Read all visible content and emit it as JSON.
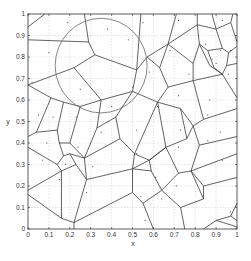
{
  "figure": {
    "xlabel": "x",
    "ylabel": "y",
    "xticks": [
      "0",
      "0.1",
      "0.2",
      "0.3",
      "0.4",
      "0.5",
      "0.6",
      "0.7",
      "0.8",
      "0.9",
      "1"
    ],
    "yticks": [
      "0",
      "0.1",
      "0.2",
      "0.3",
      "0.4",
      "0.5",
      "0.6",
      "0.7",
      "0.8",
      "0.9",
      "1"
    ]
  },
  "chart_data": {
    "type": "voronoi",
    "title": "",
    "xlabel": "x",
    "ylabel": "y",
    "xlim": [
      0,
      1
    ],
    "ylim": [
      0,
      1
    ],
    "grid": true,
    "circle": {
      "cx": 0.35,
      "cy": 0.76,
      "r": 0.22
    },
    "points": [
      [
        0.19,
        0.96
      ],
      [
        0.38,
        0.93
      ],
      [
        0.55,
        0.96
      ],
      [
        0.72,
        0.97
      ],
      [
        0.93,
        0.97
      ],
      [
        0.1,
        0.82
      ],
      [
        0.48,
        0.88
      ],
      [
        0.68,
        0.83
      ],
      [
        0.85,
        0.86
      ],
      [
        0.92,
        0.83
      ],
      [
        0.97,
        0.83
      ],
      [
        0.88,
        0.79
      ],
      [
        0.9,
        0.77
      ],
      [
        0.58,
        0.73
      ],
      [
        0.77,
        0.72
      ],
      [
        0.96,
        0.72
      ],
      [
        0.02,
        0.68
      ],
      [
        0.25,
        0.65
      ],
      [
        0.5,
        0.66
      ],
      [
        0.72,
        0.62
      ],
      [
        0.87,
        0.6
      ],
      [
        0.05,
        0.53
      ],
      [
        0.12,
        0.52
      ],
      [
        0.23,
        0.52
      ],
      [
        0.4,
        0.57
      ],
      [
        0.62,
        0.57
      ],
      [
        0.86,
        0.53
      ],
      [
        0.09,
        0.4
      ],
      [
        0.24,
        0.38
      ],
      [
        0.35,
        0.45
      ],
      [
        0.52,
        0.46
      ],
      [
        0.73,
        0.46
      ],
      [
        0.92,
        0.45
      ],
      [
        0.07,
        0.32
      ],
      [
        0.18,
        0.3
      ],
      [
        0.31,
        0.29
      ],
      [
        0.52,
        0.35
      ],
      [
        0.72,
        0.38
      ],
      [
        0.86,
        0.41
      ],
      [
        0.15,
        0.23
      ],
      [
        0.28,
        0.17
      ],
      [
        0.5,
        0.27
      ],
      [
        0.61,
        0.24
      ],
      [
        0.93,
        0.32
      ],
      [
        0.54,
        0.15
      ],
      [
        0.64,
        0.14
      ],
      [
        0.71,
        0.2
      ],
      [
        0.56,
        0.04
      ],
      [
        0.97,
        0.08
      ]
    ],
    "edges": [
      [
        [
          0,
          0.94
        ],
        [
          0.08,
          1
        ]
      ],
      [
        [
          0.27,
          1
        ],
        [
          0.29,
          0.87
        ]
      ],
      [
        [
          0,
          0.88
        ],
        [
          0.29,
          0.87
        ]
      ],
      [
        [
          0.29,
          0.87
        ],
        [
          0.32,
          0.81
        ]
      ],
      [
        [
          0.32,
          0.81
        ],
        [
          0.22,
          0.75
        ]
      ],
      [
        [
          0.22,
          0.75
        ],
        [
          0,
          0.67
        ]
      ],
      [
        [
          0.32,
          0.81
        ],
        [
          0.52,
          0.74
        ]
      ],
      [
        [
          0.52,
          0.74
        ],
        [
          0.54,
          1
        ]
      ],
      [
        [
          0.52,
          0.74
        ],
        [
          0.5,
          0.64
        ]
      ],
      [
        [
          0.52,
          0.74
        ],
        [
          0.57,
          0.8
        ]
      ],
      [
        [
          0.57,
          0.8
        ],
        [
          0.67,
          0.86
        ]
      ],
      [
        [
          0.67,
          0.86
        ],
        [
          0.71,
          1
        ]
      ],
      [
        [
          0.67,
          0.86
        ],
        [
          0.81,
          0.95
        ]
      ],
      [
        [
          0.81,
          0.95
        ],
        [
          0.81,
          1
        ]
      ],
      [
        [
          0.81,
          0.95
        ],
        [
          0.9,
          0.93
        ]
      ],
      [
        [
          0.9,
          0.93
        ],
        [
          0.88,
          1
        ]
      ],
      [
        [
          0.9,
          0.93
        ],
        [
          0.97,
          0.96
        ]
      ],
      [
        [
          0.97,
          0.96
        ],
        [
          0.98,
          1
        ]
      ],
      [
        [
          0.97,
          0.96
        ],
        [
          1,
          0.87
        ]
      ],
      [
        [
          0.9,
          0.93
        ],
        [
          0.93,
          0.84
        ]
      ],
      [
        [
          0.93,
          0.84
        ],
        [
          0.96,
          0.82
        ]
      ],
      [
        [
          0.96,
          0.82
        ],
        [
          1,
          0.85
        ]
      ],
      [
        [
          0.96,
          0.82
        ],
        [
          0.95,
          0.76
        ]
      ],
      [
        [
          0.95,
          0.76
        ],
        [
          1,
          0.77
        ]
      ],
      [
        [
          0.95,
          0.76
        ],
        [
          0.93,
          0.72
        ]
      ],
      [
        [
          0.93,
          0.84
        ],
        [
          0.86,
          0.83
        ]
      ],
      [
        [
          0.86,
          0.83
        ],
        [
          0.82,
          0.86
        ]
      ],
      [
        [
          0.82,
          0.86
        ],
        [
          0.81,
          0.95
        ]
      ],
      [
        [
          0.82,
          0.86
        ],
        [
          0.79,
          0.77
        ]
      ],
      [
        [
          0.86,
          0.83
        ],
        [
          0.89,
          0.75
        ]
      ],
      [
        [
          0.89,
          0.75
        ],
        [
          0.93,
          0.72
        ]
      ],
      [
        [
          0.82,
          0.86
        ],
        [
          0.87,
          0.76
        ]
      ],
      [
        [
          0.87,
          0.76
        ],
        [
          0.93,
          0.72
        ]
      ],
      [
        [
          0.67,
          0.86
        ],
        [
          0.63,
          0.75
        ]
      ],
      [
        [
          0.63,
          0.75
        ],
        [
          0.57,
          0.8
        ]
      ],
      [
        [
          0.63,
          0.75
        ],
        [
          0.67,
          0.66
        ]
      ],
      [
        [
          0.67,
          0.66
        ],
        [
          0.79,
          0.69
        ]
      ],
      [
        [
          0.79,
          0.69
        ],
        [
          0.79,
          0.77
        ]
      ],
      [
        [
          0.79,
          0.77
        ],
        [
          0.67,
          0.86
        ]
      ],
      [
        [
          0.79,
          0.69
        ],
        [
          0.93,
          0.72
        ]
      ],
      [
        [
          0.93,
          0.72
        ],
        [
          1,
          0.61
        ]
      ],
      [
        [
          0.79,
          0.69
        ],
        [
          0.84,
          0.51
        ]
      ],
      [
        [
          0.84,
          0.51
        ],
        [
          1,
          0.56
        ]
      ],
      [
        [
          0.84,
          0.51
        ],
        [
          0.79,
          0.48
        ]
      ],
      [
        [
          0.67,
          0.66
        ],
        [
          0.62,
          0.59
        ]
      ],
      [
        [
          0.62,
          0.59
        ],
        [
          0.5,
          0.64
        ]
      ],
      [
        [
          0.5,
          0.64
        ],
        [
          0.35,
          0.6
        ]
      ],
      [
        [
          0.35,
          0.6
        ],
        [
          0.22,
          0.75
        ]
      ],
      [
        [
          0.35,
          0.6
        ],
        [
          0.25,
          0.57
        ]
      ],
      [
        [
          0.25,
          0.57
        ],
        [
          0.17,
          0.59
        ]
      ],
      [
        [
          0.17,
          0.59
        ],
        [
          0.11,
          0.61
        ]
      ],
      [
        [
          0.11,
          0.61
        ],
        [
          0,
          0.67
        ]
      ],
      [
        [
          0.11,
          0.61
        ],
        [
          0.04,
          0.45
        ]
      ],
      [
        [
          0.04,
          0.45
        ],
        [
          0,
          0.43
        ]
      ],
      [
        [
          0.17,
          0.59
        ],
        [
          0.14,
          0.46
        ]
      ],
      [
        [
          0.14,
          0.46
        ],
        [
          0.04,
          0.45
        ]
      ],
      [
        [
          0.14,
          0.46
        ],
        [
          0.15,
          0.4
        ]
      ],
      [
        [
          0.15,
          0.4
        ],
        [
          0.2,
          0.4
        ]
      ],
      [
        [
          0.2,
          0.4
        ],
        [
          0.25,
          0.57
        ]
      ],
      [
        [
          0.2,
          0.4
        ],
        [
          0.27,
          0.33
        ]
      ],
      [
        [
          0.27,
          0.33
        ],
        [
          0.33,
          0.47
        ]
      ],
      [
        [
          0.33,
          0.47
        ],
        [
          0.35,
          0.6
        ]
      ],
      [
        [
          0.33,
          0.47
        ],
        [
          0.42,
          0.52
        ]
      ],
      [
        [
          0.42,
          0.52
        ],
        [
          0.5,
          0.64
        ]
      ],
      [
        [
          0.42,
          0.52
        ],
        [
          0.44,
          0.42
        ]
      ],
      [
        [
          0.44,
          0.42
        ],
        [
          0.27,
          0.33
        ]
      ],
      [
        [
          0.44,
          0.42
        ],
        [
          0.51,
          0.35
        ]
      ],
      [
        [
          0.51,
          0.35
        ],
        [
          0.62,
          0.59
        ]
      ],
      [
        [
          0.62,
          0.59
        ],
        [
          0.73,
          0.56
        ]
      ],
      [
        [
          0.73,
          0.56
        ],
        [
          0.79,
          0.48
        ]
      ],
      [
        [
          0.73,
          0.56
        ],
        [
          0.76,
          0.42
        ]
      ],
      [
        [
          0.76,
          0.42
        ],
        [
          0.79,
          0.48
        ]
      ],
      [
        [
          0.76,
          0.42
        ],
        [
          0.66,
          0.38
        ]
      ],
      [
        [
          0.66,
          0.38
        ],
        [
          0.62,
          0.59
        ]
      ],
      [
        [
          0.66,
          0.38
        ],
        [
          0.58,
          0.32
        ]
      ],
      [
        [
          0.58,
          0.32
        ],
        [
          0.51,
          0.35
        ]
      ],
      [
        [
          0.51,
          0.35
        ],
        [
          0.5,
          0.28
        ]
      ],
      [
        [
          0.5,
          0.28
        ],
        [
          0.58,
          0.32
        ]
      ],
      [
        [
          0.58,
          0.32
        ],
        [
          0.66,
          0.38
        ]
      ],
      [
        [
          0.79,
          0.48
        ],
        [
          0.82,
          0.39
        ]
      ],
      [
        [
          0.82,
          0.39
        ],
        [
          1,
          0.43
        ]
      ],
      [
        [
          0.82,
          0.39
        ],
        [
          0.78,
          0.27
        ]
      ],
      [
        [
          0.78,
          0.27
        ],
        [
          1,
          0.35
        ]
      ],
      [
        [
          0.78,
          0.27
        ],
        [
          0.72,
          0.26
        ]
      ],
      [
        [
          0.72,
          0.26
        ],
        [
          0.66,
          0.38
        ]
      ],
      [
        [
          0.72,
          0.26
        ],
        [
          0.64,
          0.18
        ]
      ],
      [
        [
          0.64,
          0.18
        ],
        [
          0.59,
          0.27
        ]
      ],
      [
        [
          0.59,
          0.27
        ],
        [
          0.58,
          0.32
        ]
      ],
      [
        [
          0.59,
          0.27
        ],
        [
          0.5,
          0.28
        ]
      ],
      [
        [
          0.64,
          0.18
        ],
        [
          0.55,
          0.12
        ]
      ],
      [
        [
          0.55,
          0.12
        ],
        [
          0.5,
          0.17
        ]
      ],
      [
        [
          0.5,
          0.17
        ],
        [
          0.5,
          0.28
        ]
      ],
      [
        [
          0.55,
          0.12
        ],
        [
          0.6,
          0
        ]
      ],
      [
        [
          0.64,
          0.18
        ],
        [
          0.73,
          0.1
        ]
      ],
      [
        [
          0.73,
          0.1
        ],
        [
          0.75,
          0
        ]
      ],
      [
        [
          0.73,
          0.1
        ],
        [
          0.84,
          0.14
        ]
      ],
      [
        [
          0.84,
          0.14
        ],
        [
          0.78,
          0.27
        ]
      ],
      [
        [
          0.84,
          0.14
        ],
        [
          0.84,
          0.2
        ]
      ],
      [
        [
          0.84,
          0.2
        ],
        [
          1,
          0.24
        ]
      ],
      [
        [
          0.84,
          0.2
        ],
        [
          0.78,
          0.27
        ]
      ],
      [
        [
          0.15,
          0.4
        ],
        [
          0.17,
          0.34
        ]
      ],
      [
        [
          0.17,
          0.34
        ],
        [
          0.14,
          0.3
        ]
      ],
      [
        [
          0.14,
          0.3
        ],
        [
          0,
          0.38
        ]
      ],
      [
        [
          0.14,
          0.3
        ],
        [
          0.16,
          0.27
        ]
      ],
      [
        [
          0.16,
          0.27
        ],
        [
          0,
          0.18
        ]
      ],
      [
        [
          0.17,
          0.34
        ],
        [
          0.2,
          0.35
        ]
      ],
      [
        [
          0.2,
          0.35
        ],
        [
          0.27,
          0.33
        ]
      ],
      [
        [
          0.2,
          0.35
        ],
        [
          0.23,
          0.3
        ]
      ],
      [
        [
          0.23,
          0.3
        ],
        [
          0.16,
          0.27
        ]
      ],
      [
        [
          0.23,
          0.3
        ],
        [
          0.28,
          0.23
        ]
      ],
      [
        [
          0.28,
          0.23
        ],
        [
          0.27,
          0.33
        ]
      ],
      [
        [
          0.28,
          0.23
        ],
        [
          0.5,
          0.28
        ]
      ],
      [
        [
          0.28,
          0.23
        ],
        [
          0.22,
          0.03
        ]
      ],
      [
        [
          0.22,
          0.03
        ],
        [
          0.16,
          0.05
        ]
      ],
      [
        [
          0.16,
          0.05
        ],
        [
          0,
          0.16
        ]
      ],
      [
        [
          0.16,
          0.05
        ],
        [
          0.16,
          0.27
        ]
      ],
      [
        [
          0.22,
          0.03
        ],
        [
          0.5,
          0.17
        ]
      ],
      [
        [
          0.22,
          0.03
        ],
        [
          0.22,
          0
        ]
      ],
      [
        [
          0.84,
          0
        ],
        [
          0.9,
          0.04
        ]
      ],
      [
        [
          0.9,
          0.04
        ],
        [
          0.97,
          0.06
        ]
      ],
      [
        [
          0.97,
          0.06
        ],
        [
          1,
          0.12
        ]
      ],
      [
        [
          0.97,
          0.06
        ],
        [
          1,
          0.04
        ]
      ],
      [
        [
          0.9,
          0.04
        ],
        [
          1,
          0.01
        ]
      ]
    ]
  }
}
